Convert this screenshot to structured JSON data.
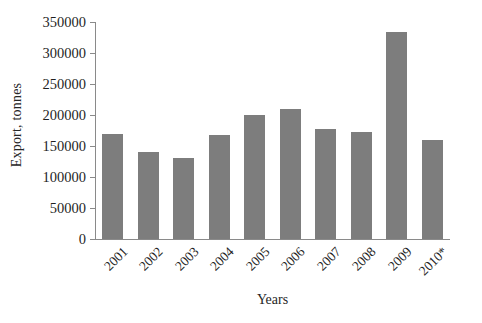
{
  "chart_data": {
    "type": "bar",
    "title": "",
    "xlabel": "Years",
    "ylabel": "Export, tonnes",
    "categories": [
      "2001",
      "2002",
      "2003",
      "2004",
      "2005",
      "2006",
      "2007",
      "2008",
      "2009",
      "2010*"
    ],
    "values": [
      170000,
      140000,
      131000,
      168000,
      200000,
      209000,
      177000,
      172000,
      334000,
      159000
    ],
    "ylim": [
      0,
      350000
    ],
    "yticks": [
      0,
      50000,
      100000,
      150000,
      200000,
      250000,
      300000,
      350000
    ],
    "ytick_labels": [
      "0",
      "50000",
      "100000",
      "150000",
      "200000",
      "250000",
      "300000",
      "350000"
    ],
    "grid": false,
    "legend": null,
    "bar_color": "#7d7d7d",
    "axis_color": "#8a8a8a",
    "background_color": "#ffffff"
  }
}
